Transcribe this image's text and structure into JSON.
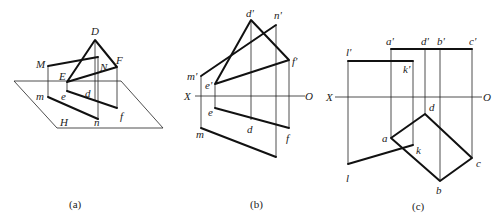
{
  "figure": {
    "panels": [
      {
        "id": "a",
        "caption": "(a)",
        "labels": {
          "D": "D",
          "M": "M",
          "E": "E",
          "N": "N",
          "F": "F",
          "m": "m",
          "e": "e",
          "d": "d",
          "f": "f",
          "n": "n",
          "H": "H"
        }
      },
      {
        "id": "b",
        "caption": "(b)",
        "labels": {
          "d1": "d'",
          "n1": "n'",
          "f1": "f'",
          "m1": "m'",
          "e1": "e'",
          "X": "X",
          "O": "O",
          "e": "e",
          "m": "m",
          "d": "d",
          "f": "f"
        }
      },
      {
        "id": "c",
        "caption": "(c)",
        "labels": {
          "a1": "a'",
          "d1": "d'",
          "b1": "b'",
          "c1": "c'",
          "l1": "l'",
          "k1": "k'",
          "X": "X",
          "O": "O",
          "d": "d",
          "a": "a",
          "k": "k",
          "c": "c",
          "l": "l",
          "b": "b"
        }
      }
    ]
  }
}
